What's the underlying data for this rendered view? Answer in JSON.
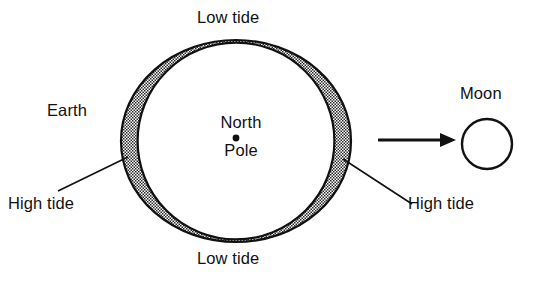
{
  "diagram": {
    "labels": {
      "low_tide_top": "Low tide",
      "low_tide_bottom": "Low tide",
      "high_tide_left": "High tide",
      "high_tide_right": "High tide",
      "earth": "Earth",
      "moon": "Moon",
      "north": "North",
      "pole": "Pole"
    },
    "colors": {
      "stroke": "#111111",
      "fill": "#ffffff",
      "stipple": "#2b2b2b",
      "background": "#ffffff"
    },
    "geometry": {
      "earth_center_x": 236,
      "earth_center_y": 141,
      "earth_radius": 99,
      "bulge_rx": 115,
      "bulge_ry": 101,
      "north_pole_dot_x": 236,
      "north_pole_dot_y": 138,
      "moon_center_x": 487,
      "moon_center_y": 144,
      "moon_radius": 25,
      "arrow_start_x": 378,
      "arrow_end_x": 455,
      "arrow_y": 140
    }
  }
}
